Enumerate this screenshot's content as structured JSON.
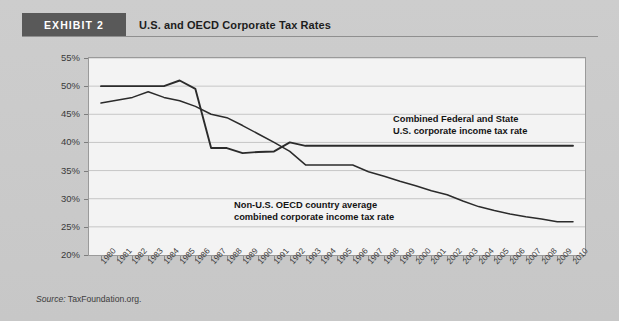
{
  "header": {
    "badge": "EXHIBIT 2",
    "title": "U.S. and OECD Corporate Tax Rates"
  },
  "source": {
    "label": "Source:",
    "text": "TaxFoundation.org."
  },
  "colors": {
    "page_background": "#c9c9c9",
    "badge_background": "#595959",
    "badge_text": "#ffffff",
    "plot_background": "#f3f3f3",
    "gridline": "#c6c6c6",
    "line": "#2b2b2b",
    "axis": "#9a9a9a",
    "tick_text": "#3a3a3a"
  },
  "annotations": [
    {
      "name": "us-line-annotation",
      "line1": "Combined Federal and State",
      "line2": "U.S. corporate income tax rate"
    },
    {
      "name": "oecd-line-annotation",
      "line1": "Non-U.S. OECD country average",
      "line2": "combined corporate income tax rate"
    }
  ],
  "chart_data": {
    "type": "line",
    "title": "U.S. and OECD Corporate Tax Rates",
    "xlabel": "",
    "ylabel": "",
    "ylim": [
      20,
      55
    ],
    "ytick_step": 5,
    "ytick_labels": [
      "55%",
      "50%",
      "45%",
      "40%",
      "35%",
      "30%",
      "25%",
      "20%"
    ],
    "ytick_values": [
      55,
      50,
      45,
      40,
      35,
      30,
      25,
      20
    ],
    "grid": true,
    "legend_position": "inline-annotations",
    "x": [
      1980,
      1981,
      1982,
      1983,
      1984,
      1985,
      1986,
      1987,
      1988,
      1989,
      1990,
      1991,
      1992,
      1993,
      1994,
      1995,
      1996,
      1997,
      1998,
      1999,
      2000,
      2001,
      2002,
      2003,
      2004,
      2005,
      2006,
      2007,
      2008,
      2009,
      2010
    ],
    "xtick_labels": [
      "1980",
      "1981",
      "1982",
      "1983",
      "1984",
      "1985",
      "1986",
      "1987",
      "1988",
      "1989",
      "1990",
      "1991",
      "1992",
      "1993",
      "1994",
      "1995",
      "1996",
      "1997",
      "1998",
      "1999",
      "2000",
      "2001",
      "2002",
      "2003",
      "2004",
      "2005",
      "2006",
      "2007",
      "2008",
      "2009",
      "2010"
    ],
    "series": [
      {
        "name": "Combined Federal and State U.S. corporate income tax rate",
        "values": [
          50.0,
          50.0,
          50.0,
          50.0,
          50.0,
          51.0,
          49.5,
          39.0,
          39.0,
          38.1,
          38.3,
          38.4,
          40.0,
          39.4,
          39.4,
          39.4,
          39.4,
          39.4,
          39.4,
          39.4,
          39.4,
          39.4,
          39.4,
          39.4,
          39.4,
          39.4,
          39.4,
          39.4,
          39.4,
          39.4,
          39.4
        ]
      },
      {
        "name": "Non-U.S. OECD country average combined corporate income tax rate",
        "values": [
          47.0,
          47.5,
          48.0,
          49.0,
          48.0,
          47.4,
          46.4,
          45.0,
          44.4,
          43.0,
          41.5,
          40.0,
          38.4,
          36.0,
          36.0,
          36.0,
          36.0,
          34.8,
          34.0,
          33.1,
          32.3,
          31.4,
          30.7,
          29.6,
          28.6,
          27.9,
          27.3,
          26.8,
          26.4,
          25.9,
          25.9
        ]
      }
    ]
  }
}
